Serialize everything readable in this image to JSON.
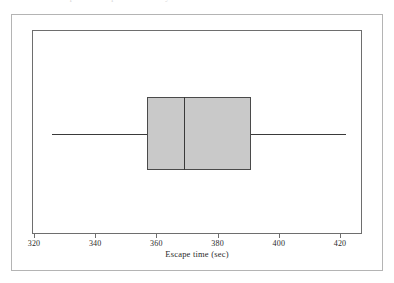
{
  "figure": {
    "caption_partial": "…box plot… escape time… study…"
  },
  "chart_data": {
    "type": "box",
    "title": "",
    "subtitle": "",
    "xlabel": "Escape time (sec)",
    "ylabel": "",
    "orientation": "horizontal",
    "grid": false,
    "legend": null,
    "xlim": [
      320,
      430
    ],
    "axis": {
      "tick_labels": [
        "320",
        "340",
        "360",
        "380",
        "400",
        "420"
      ],
      "tick_values": [
        320,
        340,
        360,
        380,
        400,
        420
      ],
      "tick_interval": 20,
      "axis_start_value": 320,
      "axis_end_value": 428
    },
    "boxes": [
      {
        "name": "escape-time",
        "whisker_low": 326,
        "q1": 357,
        "median": 369,
        "q3": 391,
        "whisker_high": 422,
        "outliers": [],
        "iqr": 34
      }
    ],
    "colors": {
      "box_fill": "#c9c9c9",
      "box_stroke": "#4a4a4a",
      "median_stroke": "#3a3a3a",
      "whisker_stroke": "#3a3a3a",
      "frame_stroke": "#6e6e6e",
      "outer_border_stroke": "#b4b4b4",
      "background": "#ffffff",
      "text": "#2a2a2a"
    }
  }
}
